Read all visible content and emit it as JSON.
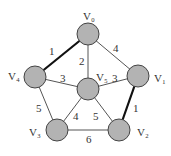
{
  "graph": {
    "node_fill": "#b3b3b3",
    "node_stroke": "#444444",
    "edge_color": "#555555",
    "bold_edge_color": "#111111",
    "nodes": [
      {
        "id": "V0",
        "label": "V₀",
        "x": 88,
        "y": 34,
        "lx": 83,
        "ly": 20
      },
      {
        "id": "V1",
        "label": "V₁",
        "x": 138,
        "y": 76,
        "lx": 154,
        "ly": 82
      },
      {
        "id": "V2",
        "label": "V₂",
        "x": 119,
        "y": 130,
        "lx": 137,
        "ly": 136
      },
      {
        "id": "V3",
        "label": "V₃",
        "x": 57,
        "y": 130,
        "lx": 29,
        "ly": 136
      },
      {
        "id": "V4",
        "label": "V₄",
        "x": 35,
        "y": 77,
        "lx": 8,
        "ly": 80
      },
      {
        "id": "V5",
        "label": "V₅",
        "x": 88,
        "y": 89,
        "lx": 96,
        "ly": 81
      }
    ],
    "edges": [
      {
        "from": "V0",
        "to": "V4",
        "weight": "1",
        "bold": true,
        "wx": 49,
        "wy": 55
      },
      {
        "from": "V0",
        "to": "V5",
        "weight": "2",
        "bold": false,
        "wx": 79,
        "wy": 65
      },
      {
        "from": "V0",
        "to": "V1",
        "weight": "4",
        "bold": false,
        "wx": 113,
        "wy": 52
      },
      {
        "from": "V4",
        "to": "V5",
        "weight": "3",
        "bold": false,
        "wx": 60,
        "wy": 82
      },
      {
        "from": "V5",
        "to": "V1",
        "weight": "3",
        "bold": false,
        "wx": 112,
        "wy": 82
      },
      {
        "from": "V1",
        "to": "V2",
        "weight": "1",
        "bold": true,
        "wx": 133,
        "wy": 112
      },
      {
        "from": "V4",
        "to": "V3",
        "weight": "5",
        "bold": false,
        "wx": 36,
        "wy": 112
      },
      {
        "from": "V5",
        "to": "V3",
        "weight": "4",
        "bold": false,
        "wx": 73,
        "wy": 120
      },
      {
        "from": "V5",
        "to": "V2",
        "weight": "5",
        "bold": false,
        "wx": 93,
        "wy": 120
      },
      {
        "from": "V3",
        "to": "V2",
        "weight": "6",
        "bold": false,
        "wx": 86,
        "wy": 143
      }
    ]
  }
}
